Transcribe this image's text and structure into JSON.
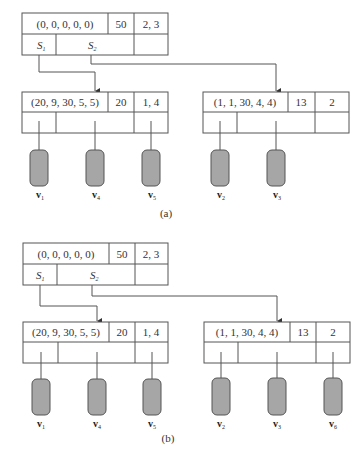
{
  "figure": {
    "panels": [
      {
        "caption": "(a)",
        "root": {
          "key": "(0, 0, 0, 0, 0)",
          "count": "50",
          "ids": "2, 3",
          "pointers": [
            {
              "label": "S",
              "sub": "1"
            },
            {
              "label": "S",
              "sub": "2"
            }
          ]
        },
        "children": [
          {
            "key": "(20, 9, 30, 5, 5)",
            "count": "20",
            "ids": "1, 4",
            "vectors": [
              {
                "label": "v",
                "sub": "1"
              },
              {
                "label": "v",
                "sub": "4"
              },
              {
                "label": "v",
                "sub": "5"
              }
            ]
          },
          {
            "key": "(1, 1, 30, 4, 4)",
            "count": "13",
            "ids": "2",
            "vectors": [
              {
                "label": "v",
                "sub": "2"
              },
              {
                "label": "v",
                "sub": "3"
              }
            ]
          }
        ]
      },
      {
        "caption": "(b)",
        "root": {
          "key": "(0, 0, 0, 0, 0)",
          "count": "50",
          "ids": "2, 3",
          "pointers": [
            {
              "label": "S",
              "sub": "1"
            },
            {
              "label": "S",
              "sub": "2"
            }
          ]
        },
        "children": [
          {
            "key": "(20, 9, 30, 5, 5)",
            "count": "20",
            "ids": "1, 4",
            "vectors": [
              {
                "label": "v",
                "sub": "1"
              },
              {
                "label": "v",
                "sub": "4"
              },
              {
                "label": "v",
                "sub": "5"
              }
            ]
          },
          {
            "key": "(1, 1, 30, 4, 4)",
            "count": "13",
            "ids": "2",
            "vectors": [
              {
                "label": "v",
                "sub": "2"
              },
              {
                "label": "v",
                "sub": "3"
              },
              {
                "label": "v",
                "sub": "6"
              }
            ]
          }
        ]
      }
    ]
  },
  "colors": {
    "vector_fill": "#a6a6a6",
    "stroke": "#555555"
  }
}
